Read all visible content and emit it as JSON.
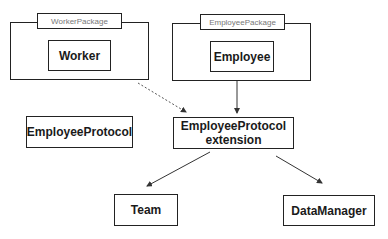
{
  "packages": [
    {
      "name": "WorkerPackage",
      "contains": "Worker"
    },
    {
      "name": "EmployeePackage",
      "contains": "Employee"
    }
  ],
  "nodes": {
    "worker": "Worker",
    "employee": "Employee",
    "employee_protocol": "EmployeeProtocol",
    "extension_line1": "EmployeeProtocol",
    "extension_line2": "extension",
    "team": "Team",
    "data_manager": "DataManager"
  },
  "edges": [
    {
      "from": "WorkerPackage",
      "to": "EmployeeProtocol extension",
      "style": "dashed"
    },
    {
      "from": "EmployeePackage",
      "to": "EmployeeProtocol extension",
      "style": "solid"
    },
    {
      "from": "EmployeeProtocol extension",
      "to": "Team",
      "style": "solid"
    },
    {
      "from": "EmployeeProtocol extension",
      "to": "DataManager",
      "style": "solid"
    }
  ]
}
